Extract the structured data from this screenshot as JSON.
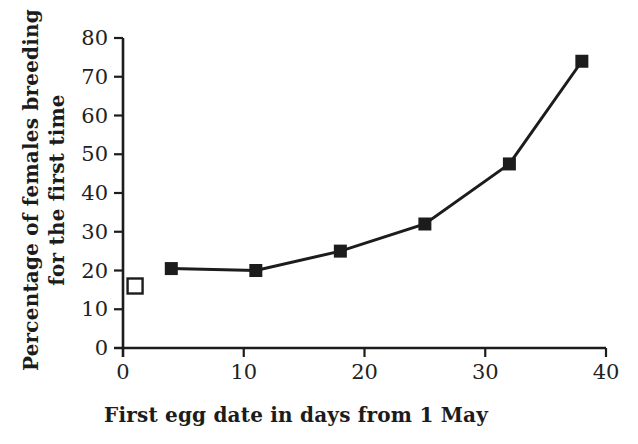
{
  "chart_data": {
    "type": "line",
    "title": "",
    "xlabel": "First egg date in days from 1 May",
    "ylabel": "Percentage of females breeding for the first time",
    "ylabel_line1": "Percentage of females breeding",
    "ylabel_line2": "for the first time",
    "xlim": [
      0,
      40
    ],
    "ylim": [
      0,
      80
    ],
    "xticks": [
      0,
      10,
      20,
      30,
      40
    ],
    "yticks": [
      0,
      10,
      20,
      30,
      40,
      50,
      60,
      70,
      80
    ],
    "grid": "off",
    "legend": "none",
    "series": [
      {
        "name": "females-breeding-first-time",
        "marker": "filled-square",
        "connected": true,
        "points": [
          {
            "x": 4,
            "y": 20.5
          },
          {
            "x": 11,
            "y": 20
          },
          {
            "x": 18,
            "y": 25
          },
          {
            "x": 25,
            "y": 32
          },
          {
            "x": 32,
            "y": 47.5
          },
          {
            "x": 38,
            "y": 74
          }
        ]
      },
      {
        "name": "open-square-point",
        "marker": "open-square",
        "connected": false,
        "points": [
          {
            "x": 1,
            "y": 16
          }
        ]
      }
    ],
    "colors": {
      "ink": "#1c1c1c",
      "background": "#ffffff"
    }
  }
}
